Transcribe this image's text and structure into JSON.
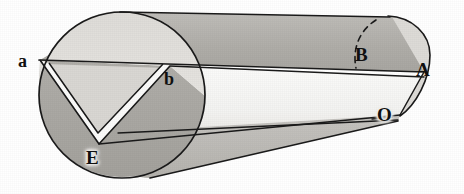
{
  "figure": {
    "kind": "geometry-diagram",
    "width": 464,
    "height": 194,
    "background_color": "#ffffff",
    "stroke_color": "#1a1a1a"
  },
  "palette": {
    "paper": "#ffffff",
    "ink": "#1a1a1a",
    "cap_upper_light": "#e2e0dc",
    "cap_lower_dark": "#a9a7a4",
    "body_top_dark": "#b2b0ac",
    "body_middle_white": "#f7f7f5",
    "body_bottom_mid": "#bdbbb7",
    "notch_face_light": "#d8d6d2",
    "notch_groove_white": "#fbfbfa",
    "endcap_right_light": "#dddbd7"
  },
  "labels": [
    {
      "id": "a",
      "text": "a",
      "case": "lower",
      "x": 18,
      "y": 52,
      "note": "left end of the upper chord on the near circular face"
    },
    {
      "id": "b",
      "text": "b",
      "case": "lower",
      "x": 164,
      "y": 70,
      "note": "right end of the upper chord where the face meets the barrel"
    },
    {
      "id": "B",
      "text": "B",
      "case": "upper",
      "x": 355,
      "y": 45,
      "note": "point on the far end, at the dashed hidden arc"
    },
    {
      "id": "A",
      "text": "A",
      "case": "upper",
      "x": 416,
      "y": 60,
      "note": "far right vertex on the axis line"
    },
    {
      "id": "O",
      "text": "O",
      "case": "upper",
      "x": 377,
      "y": 105,
      "note": "lower right vertex below A"
    },
    {
      "id": "E",
      "text": "E",
      "case": "upper",
      "x": 86,
      "y": 148,
      "note": "apex of the V notch on the near face"
    }
  ],
  "geometry": {
    "near_circle": {
      "cx": 122,
      "cy": 95,
      "r": 83
    },
    "chord_ab": {
      "x1": 40,
      "y1": 60,
      "x2": 170,
      "y2": 66
    },
    "notch_apex": {
      "x": 98,
      "y": 141
    },
    "axis_line": {
      "x1": 40,
      "y1": 60,
      "x2": 424,
      "y2": 72
    },
    "right_end": {
      "apex_A": {
        "x": 424,
        "y": 72
      },
      "point_O": {
        "x": 400,
        "y": 115
      }
    },
    "dashed_arc": {
      "from": {
        "x": 374,
        "y": 22
      },
      "to": {
        "x": 356,
        "y": 68
      }
    }
  }
}
